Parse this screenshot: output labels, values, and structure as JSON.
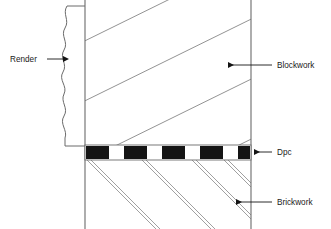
{
  "diagram": {
    "type": "architectural-cross-section",
    "background_color": "#ffffff",
    "line_color": "#6b6b6b",
    "dark_color": "#141414",
    "text_color": "#1a1a1a"
  },
  "labels": [
    {
      "id": "render",
      "text": "Render",
      "side": "left",
      "text_x": 10,
      "text_y": 62,
      "leader_from_x": 47,
      "leader_to_x": 64,
      "leader_y": 59,
      "arrow_direction": "right"
    },
    {
      "id": "blockwork",
      "text": "Blockwork",
      "side": "right",
      "text_x": 277,
      "text_y": 68,
      "leader_from_x": 272,
      "leader_to_x": 228,
      "leader_y": 65,
      "arrow_direction": "left"
    },
    {
      "id": "dpc",
      "text": "Dpc",
      "side": "right",
      "text_x": 277,
      "text_y": 155,
      "leader_from_x": 272,
      "leader_to_x": 254,
      "leader_y": 152,
      "arrow_direction": "left"
    },
    {
      "id": "brickwork",
      "text": "Brickwork",
      "side": "right",
      "text_x": 277,
      "text_y": 205,
      "leader_from_x": 272,
      "leader_to_x": 236,
      "leader_y": 202,
      "arrow_direction": "left"
    }
  ],
  "layers": {
    "render": {
      "name": "Render",
      "description": "Wavy outer render coat on left face of blockwork",
      "wave_x": 64,
      "top_y": 6,
      "bottom_y": 146,
      "amplitude": 3.5
    },
    "blockwork": {
      "name": "Blockwork",
      "description": "Single diagonal hatch lines rising to the right",
      "left_x": 85,
      "right_x": 251,
      "top_y": 0,
      "bottom_y": 145,
      "hatch_count": 5,
      "hatch_style": "single-line"
    },
    "dpc": {
      "name": "Dpc",
      "description": "Damp proof course shown as alternating black and white band",
      "left_x": 85,
      "right_x": 251,
      "top_y": 145,
      "bottom_y": 160,
      "segment_count": 9,
      "fill_pattern": [
        "black",
        "white",
        "black",
        "white",
        "black",
        "white",
        "black",
        "white",
        "black"
      ]
    },
    "brickwork": {
      "name": "Brickwork",
      "description": "Double diagonal hatch lines falling to the right",
      "left_x": 85,
      "right_x": 251,
      "top_y": 160,
      "bottom_y": 229,
      "hatch_count": 4,
      "hatch_style": "double-line"
    }
  },
  "walls": {
    "left_edge_x": 85,
    "right_edge_x": 251,
    "top_y": 0,
    "bottom_y": 229
  }
}
